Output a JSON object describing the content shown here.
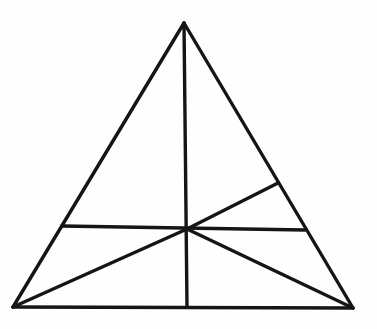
{
  "diagram": {
    "background_color": "#fefefe",
    "stroke_color": "#151515",
    "stroke_width": 3.4,
    "canvas": {
      "width": 377,
      "height": 329
    },
    "points": {
      "apex": [
        184,
        23
      ],
      "bottom_left": [
        13,
        307
      ],
      "bottom_right": [
        353,
        308
      ],
      "base_midpoint": [
        187,
        307
      ],
      "center": [
        187,
        229
      ],
      "left_side_point": [
        62,
        226
      ],
      "right_side_low_point": [
        305,
        230
      ],
      "right_side_high_point": [
        278,
        183
      ]
    },
    "segments": [
      {
        "name": "triangle-edge-left",
        "from": "apex",
        "to": "bottom_left"
      },
      {
        "name": "triangle-edge-right",
        "from": "apex",
        "to": "bottom_right"
      },
      {
        "name": "triangle-edge-bottom",
        "from": "bottom_left",
        "to": "bottom_right"
      },
      {
        "name": "vertical-median",
        "from": "apex",
        "to": "base_midpoint"
      },
      {
        "name": "horizontal-chord",
        "from": "left_side_point",
        "to": "right_side_low_point"
      },
      {
        "name": "cevian-bottomleft-to-center",
        "from": "bottom_left",
        "to": "center"
      },
      {
        "name": "cevian-center-to-right-side",
        "from": "center",
        "to": "right_side_high_point"
      },
      {
        "name": "segment-center-to-bottomright",
        "from": "center",
        "to": "bottom_right"
      }
    ]
  }
}
